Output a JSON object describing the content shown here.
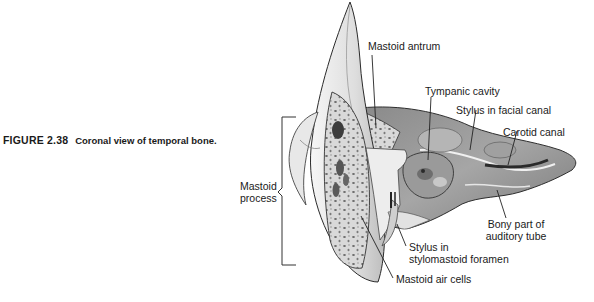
{
  "caption": {
    "figure_number": "FIGURE 2.38",
    "text": "Coronal view of temporal bone."
  },
  "labels": {
    "mastoid_antrum": "Mastoid antrum",
    "tympanic_cavity": "Tympanic cavity",
    "stylus_facial_canal": "Stylus in facial canal",
    "carotid_canal": "Carotid canal",
    "mastoid_process_line1": "Mastoid",
    "mastoid_process_line2": "process",
    "bony_part_line1": "Bony part of",
    "bony_part_line2": "auditory tube",
    "stylus_stylomastoid_line1": "Stylus in",
    "stylus_stylomastoid_line2": "stylomastoid foramen",
    "mastoid_air_cells": "Mastoid air cells"
  },
  "colors": {
    "bone_light": "#ececec",
    "bone_mid": "#c8c8c8",
    "cavity_dark": "#6e6e6e",
    "outline": "#333333"
  }
}
